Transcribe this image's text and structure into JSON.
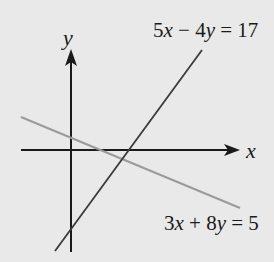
{
  "diagram": {
    "type": "coordinate-plane-lines",
    "axes": {
      "x_label": "x",
      "y_label": "y"
    },
    "lines": [
      {
        "equation": "5x − 4y = 17",
        "parts": [
          "5",
          "x",
          " − 4",
          "y",
          " = 17"
        ],
        "color": "#3a3a3a"
      },
      {
        "equation": "3x + 8y = 5",
        "parts": [
          "3",
          "x",
          " + 8",
          "y",
          " = 5"
        ],
        "color": "#9a9a9a"
      }
    ],
    "colors": {
      "background": "#e9e9e9",
      "axes": "#1a1a1a"
    }
  }
}
